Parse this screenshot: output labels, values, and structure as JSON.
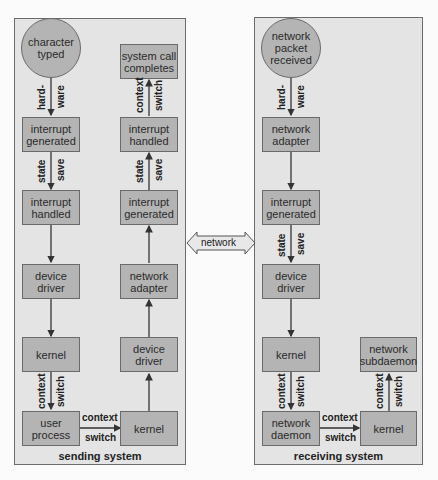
{
  "sending_system": {
    "title": "sending system",
    "nodes": {
      "character_typed": "character\ntyped",
      "interrupt_generated": "interrupt\ngenerated",
      "interrupt_handled": "interrupt\nhandled",
      "device_driver": "device\ndriver",
      "kernel": "kernel",
      "user_process": "user\nprocess",
      "kernel2": "kernel",
      "device_driver2": "device\ndriver",
      "network_adapter": "network\nadapter",
      "interrupt_generated2": "interrupt\ngenerated",
      "interrupt_handled2": "interrupt\nhandled",
      "system_call_completes": "system call\ncompletes"
    },
    "edge_labels": {
      "hard": "hard-",
      "ware": "ware",
      "state": "state",
      "save": "save",
      "context": "context",
      "switch": "switch",
      "context_h": "context",
      "switch_h": "switch",
      "state2": "state",
      "save2": "save",
      "context2": "context",
      "switch2": "switch"
    }
  },
  "network_link": {
    "label": "network"
  },
  "receiving_system": {
    "title": "receiving system",
    "nodes": {
      "network_packet_received": "network\npacket\nreceived",
      "network_adapter": "network\nadapter",
      "interrupt_generated": "interrupt\ngenerated",
      "device_driver": "device\ndriver",
      "kernel": "kernel",
      "network_daemon": "network\ndaemon",
      "kernel2": "kernel",
      "network_subdaemon": "network\nsubdaemon"
    },
    "edge_labels": {
      "hard": "hard-",
      "ware": "ware",
      "state": "state",
      "save": "save",
      "context": "context",
      "switch": "switch",
      "context_h": "context",
      "switch_h": "switch",
      "context2": "context",
      "switch2": "switch"
    }
  },
  "colors": {
    "panel_bg": "#e4e4e4",
    "node_fill": "#b4b4b4",
    "border": "#6a6a6a",
    "network_arrow_fill": "#e8e8e8"
  }
}
